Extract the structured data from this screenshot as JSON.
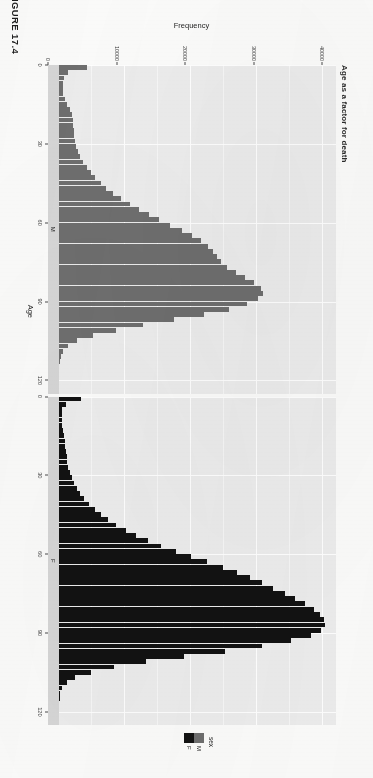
{
  "figure": {
    "label": "FIGURE 17.4"
  },
  "chart_data": {
    "type": "bar",
    "title": "Age as a factor for death",
    "xlabel": "Age",
    "ylabel": "Frequency",
    "orientation": "vertical-histogram-rotated-page",
    "grid": true,
    "legend": {
      "title": "sex",
      "position": "right",
      "entries": [
        {
          "label": "M",
          "color": "#6e6e6e"
        },
        {
          "label": "F",
          "color": "#121212"
        }
      ]
    },
    "facets": [
      {
        "strip_label": "M",
        "color": "#6e6e6e"
      },
      {
        "strip_label": "F",
        "color": "#121212"
      }
    ],
    "xlim": [
      0,
      125
    ],
    "ylim": [
      0,
      42000
    ],
    "xticks": [
      0,
      30,
      60,
      90,
      120
    ],
    "yticks": [
      0,
      10000,
      20000,
      30000,
      40000
    ],
    "ytick_labels": [
      "0",
      "10000",
      "20000",
      "30000",
      "40000"
    ],
    "xtick_labels": [
      "0",
      "30",
      "60",
      "90",
      "120"
    ],
    "bin_width": 2,
    "x": [
      0,
      2,
      4,
      6,
      8,
      10,
      12,
      14,
      16,
      18,
      20,
      22,
      24,
      26,
      28,
      30,
      32,
      34,
      36,
      38,
      40,
      42,
      44,
      46,
      48,
      50,
      52,
      54,
      56,
      58,
      60,
      62,
      64,
      66,
      68,
      70,
      72,
      74,
      76,
      78,
      80,
      82,
      84,
      86,
      88,
      90,
      92,
      94,
      96,
      98,
      100,
      102,
      104,
      106,
      108,
      110,
      112,
      114,
      116,
      118,
      120
    ],
    "series": [
      {
        "name": "M",
        "color": "#6e6e6e",
        "values": [
          4200,
          1300,
          700,
          620,
          600,
          640,
          900,
          1250,
          1700,
          2000,
          2150,
          2200,
          2250,
          2300,
          2400,
          2600,
          2900,
          3250,
          3700,
          4200,
          4800,
          5500,
          6300,
          7200,
          8200,
          9400,
          10700,
          12100,
          13600,
          15200,
          16900,
          18600,
          20200,
          21500,
          22600,
          23400,
          24000,
          24600,
          25500,
          26800,
          28200,
          29600,
          30600,
          30900,
          30200,
          28500,
          25800,
          22000,
          17500,
          12800,
          8600,
          5200,
          2800,
          1350,
          600,
          250,
          100,
          40,
          15,
          6,
          2
        ]
      },
      {
        "name": "F",
        "color": "#121212",
        "values": [
          3300,
          1000,
          520,
          460,
          440,
          470,
          560,
          700,
          850,
          980,
          1080,
          1150,
          1250,
          1400,
          1600,
          1900,
          2300,
          2750,
          3250,
          3850,
          4550,
          5400,
          6400,
          7500,
          8700,
          10100,
          11700,
          13500,
          15500,
          17700,
          20000,
          22400,
          24800,
          27000,
          29000,
          30800,
          32500,
          34200,
          35800,
          37300,
          38600,
          39600,
          40200,
          40400,
          39800,
          38200,
          35200,
          30800,
          25200,
          19000,
          13200,
          8400,
          4800,
          2500,
          1200,
          520,
          200,
          80,
          28,
          10,
          3
        ]
      }
    ]
  }
}
